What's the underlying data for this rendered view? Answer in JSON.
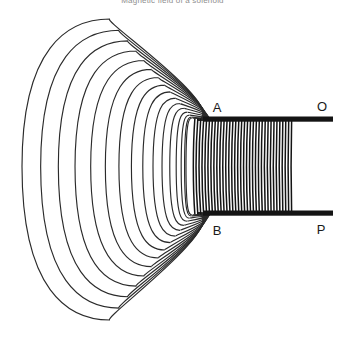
{
  "figure": {
    "title": "Magnetic field of a solenoid",
    "background_color": "#ffffff",
    "line_color": "#2b2b2b",
    "coil_color": "#141414",
    "label_color": "#1a1a1a"
  },
  "labels": {
    "a": "A",
    "b": "B",
    "o": "O",
    "p": "P"
  },
  "chart_data": {
    "type": "diagram",
    "title": "Magnetic field of a solenoid",
    "elements": {
      "solenoid": {
        "turns": 34,
        "coil_left_x": 196,
        "coil_right_x": 292,
        "coil_top_y": 120,
        "coil_bottom_y": 213,
        "convergence_point_top": [
          198,
          120
        ],
        "convergence_point_bottom": [
          198,
          213
        ]
      },
      "terminals": [
        {
          "name": "O",
          "label": "O",
          "bar_y": 119,
          "bar_x_start": 203,
          "bar_x_end": 333,
          "label_x": 322,
          "label_y": 110
        },
        {
          "name": "P",
          "label": "P",
          "bar_y": 213,
          "bar_x_start": 203,
          "bar_x_end": 333,
          "label_x": 321,
          "label_y": 233
        }
      ],
      "pole_points": [
        {
          "name": "A",
          "label": "A",
          "x": 217,
          "y": 112,
          "marks": "top end of solenoid core"
        },
        {
          "name": "B",
          "label": "B",
          "x": 217,
          "y": 234,
          "marks": "bottom end of solenoid core"
        }
      ],
      "field_lines": {
        "count": 16,
        "description": "Nested closed magnetic field loops encircling the solenoid, converging at points A and B",
        "outermost_extent": {
          "left_x": 22,
          "right_x": 292,
          "top_y": 19,
          "bottom_y": 320
        },
        "innermost_extent": {
          "left_x": 186,
          "right_x": 292,
          "top_y": 118,
          "bottom_y": 215
        }
      }
    },
    "xlabel": "",
    "ylabel": "",
    "grid": false,
    "legend": "none"
  }
}
